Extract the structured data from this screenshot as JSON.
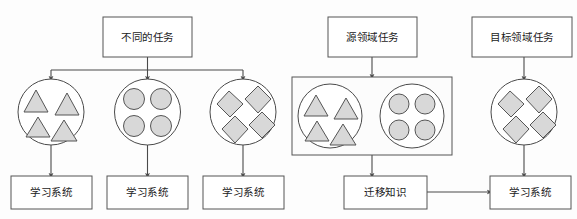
{
  "diagram": {
    "title_left": "不同的任务",
    "title_source": "源领域任务",
    "title_target": "目标领域任务",
    "learning_system_1": "学习系统",
    "learning_system_2": "学习系统",
    "learning_system_3": "学习系统",
    "transfer_knowledge": "迁移知识",
    "learning_system_target": "学习系统",
    "colors": {
      "shape_fill": "#d8d8d8",
      "stroke": "#555555",
      "background": "#fdfdfd",
      "text": "#1a1a1a"
    },
    "left_panel": {
      "root_label": "不同的任务",
      "branches": [
        {
          "shape_type": "triangle",
          "shape_count": 4,
          "output_label": "学习系统"
        },
        {
          "shape_type": "circle",
          "shape_count": 4,
          "output_label": "学习系统"
        },
        {
          "shape_type": "diamond",
          "shape_count": 4,
          "output_label": "学习系统"
        }
      ]
    },
    "right_panel": {
      "source_label": "源领域任务",
      "target_label": "目标领域任务",
      "source_groups": [
        {
          "shape_type": "triangle",
          "shape_count": 4
        },
        {
          "shape_type": "circle",
          "shape_count": 4
        }
      ],
      "target_group": {
        "shape_type": "diamond",
        "shape_count": 4
      },
      "transfer_label": "迁移知识",
      "target_output_label": "学习系统"
    }
  }
}
